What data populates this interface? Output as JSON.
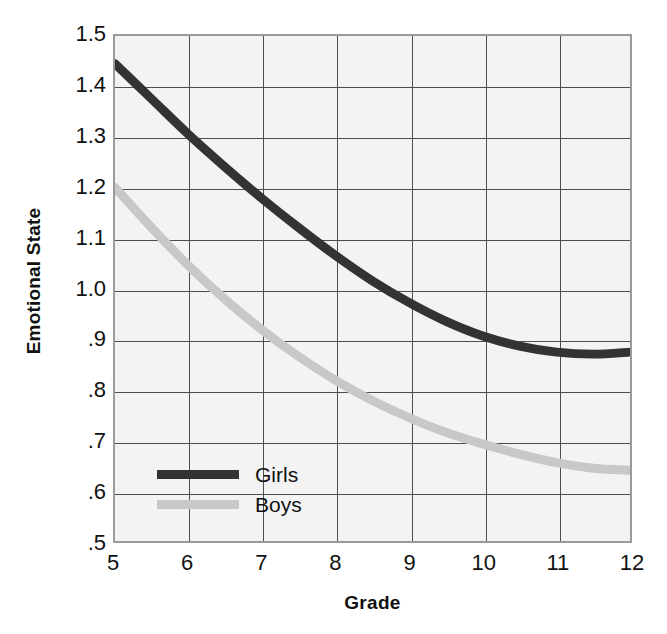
{
  "chart_data": {
    "type": "line",
    "title": "",
    "xlabel": "Grade",
    "ylabel": "Emotional State",
    "xlim": [
      5,
      12
    ],
    "ylim": [
      0.5,
      1.5
    ],
    "xticks": [
      5,
      6,
      7,
      8,
      9,
      10,
      11,
      12
    ],
    "xticklabels": [
      "5",
      "6",
      "7",
      "8",
      "9",
      "10",
      "11",
      "12"
    ],
    "yticks": [
      0.5,
      0.6,
      0.7,
      0.8,
      0.9,
      1.0,
      1.1,
      1.2,
      1.3,
      1.4,
      1.5
    ],
    "yticklabels": [
      ".5",
      ".6",
      ".7",
      ".8",
      ".9",
      "1.0",
      "1.1",
      "1.2",
      "1.3",
      "1.4",
      "1.5"
    ],
    "grid": true,
    "legend_position": "lower left",
    "x": [
      5,
      5.5,
      6,
      6.5,
      7,
      7.5,
      8,
      8.5,
      9,
      9.5,
      10,
      10.5,
      11,
      11.5,
      12
    ],
    "series": [
      {
        "name": "Girls",
        "color": "#333333",
        "values": [
          1.445,
          1.375,
          1.305,
          1.24,
          1.178,
          1.12,
          1.065,
          1.015,
          0.972,
          0.935,
          0.906,
          0.886,
          0.874,
          0.87,
          0.874
        ]
      },
      {
        "name": "Boys",
        "color": "#c8c8c8",
        "values": [
          1.2,
          1.12,
          1.045,
          0.978,
          0.918,
          0.865,
          0.818,
          0.778,
          0.744,
          0.715,
          0.692,
          0.672,
          0.655,
          0.644,
          0.64
        ]
      }
    ]
  },
  "legend": {
    "items": [
      {
        "label": "Girls",
        "color": "#333333"
      },
      {
        "label": "Boys",
        "color": "#c8c8c8"
      }
    ]
  },
  "axes": {
    "x_title": "Grade",
    "y_title": "Emotional State"
  }
}
